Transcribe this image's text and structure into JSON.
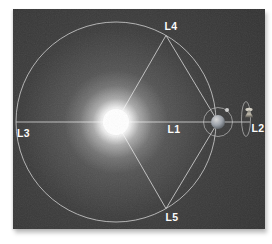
{
  "figure": {
    "labels": {
      "l1": "L1",
      "l2": "L2",
      "l3": "L3",
      "l4": "L4",
      "l5": "L5"
    },
    "icons": {
      "sun": "sun-glow-icon",
      "earth": "earth-sphere-icon",
      "moon": "moon-dot-icon",
      "moon_orbit": "moon-orbit-circle-icon",
      "earth_orbit": "earth-orbit-circle-icon",
      "halo_orbit": "l2-halo-orbit-ellipse-icon",
      "spacecraft": "spacecraft-at-l2-icon"
    },
    "colors": {
      "page": "#ffffff",
      "image_bg": "#3c3c3c",
      "line": "#c8c8c8",
      "label": "#ffffff",
      "sun_core": "#ffffff",
      "earth_light": "#d8d8d8",
      "earth_dark": "#5d6268",
      "moon": "#cfcfcf",
      "spacecraft": "#b5b0a2"
    }
  }
}
